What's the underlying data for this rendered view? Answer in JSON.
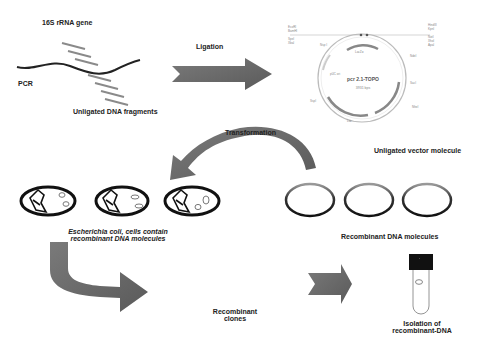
{
  "figure": {
    "labels": {
      "gene": "16S rRNA gene",
      "pcr": "PCR",
      "fragments": "Unligated DNA fragments",
      "ligation": "Ligation",
      "vector": "Unligated vector molecule",
      "plasmid_name": "pcr 2.1-TOPO",
      "plasmid_size": "3931 bps",
      "transformation": "Transformation",
      "ecoli_line1": "Escherichia coli, cells contain",
      "ecoli_line2": "recombinant DNA molecules",
      "recombinant_dna": "Recombinant DNA molecules",
      "clones_line1": "Recombinant",
      "clones_line2": "clones",
      "isolation_line1": "Isolation of",
      "isolation_line2": "recombinant-DNA"
    },
    "colors": {
      "arrow": "#6b6b6b",
      "dna": "#222222",
      "fragment": "#8a8a8a",
      "ring_top": "#aaaaaa",
      "tube_cap": "#111111"
    },
    "steps": [
      "PCR",
      "Ligation",
      "Transformation",
      "Recombinant clones",
      "Isolation of recombinant-DNA"
    ]
  }
}
